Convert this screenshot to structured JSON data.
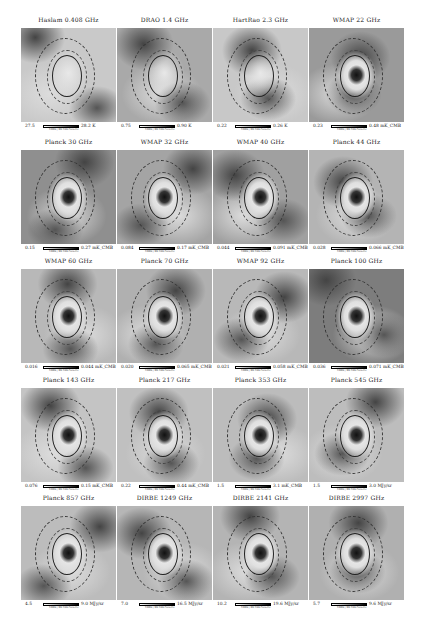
{
  "figure": {
    "panels": [
      {
        "title": "Haslam 0.408 GHz",
        "min": "27.5",
        "max": "28.2 K",
        "sub": "DBBS | BR DSS Galactic",
        "bg": "#c9c9c9",
        "core": "none"
      },
      {
        "title": "DRAO 1.4 GHz",
        "min": "0.75",
        "max": "0.90 K",
        "sub": "DBBS | BR DSS Galactic",
        "bg": "#a9a9a9",
        "core": "none"
      },
      {
        "title": "HartRao 2.3 GHz",
        "min": "0.22",
        "max": "0.26 K",
        "sub": "DBBS | BR DSS Galactic",
        "bg": "#c8c8c8",
        "core": "none"
      },
      {
        "title": "WMAP 22 GHz",
        "min": "0.23",
        "max": "0.48 mK_CMB",
        "sub": "DBBS | BR DSS Galactic",
        "bg": "#9a9a9a",
        "core": "dark"
      },
      {
        "title": "Planck 30 GHz",
        "min": "0.15",
        "max": "0.27 mK_CMB",
        "sub": "DBBS | BR DSS Galactic",
        "bg": "#8f8f8f",
        "core": "dark"
      },
      {
        "title": "WMAP 32 GHz",
        "min": "0.084",
        "max": "0.17 mK_CMB",
        "sub": "DBBS | BR DSS Galactic",
        "bg": "#a4a4a4",
        "core": "dark"
      },
      {
        "title": "WMAP 40 GHz",
        "min": "0.044",
        "max": "0.091 mK_CMB",
        "sub": "DBBS | BR DSS Galactic",
        "bg": "#a0a0a0",
        "core": "dark"
      },
      {
        "title": "Planck 44 GHz",
        "min": "0.028",
        "max": "0.066 mK_CMB",
        "sub": "DBBS | BR DSS Galactic",
        "bg": "#b4b4b4",
        "core": "dark"
      },
      {
        "title": "WMAP 60 GHz",
        "min": "0.016",
        "max": "0.044 mK_CMB",
        "sub": "DBBS | BR DSS Galactic",
        "bg": "#b8b8b8",
        "core": "dark"
      },
      {
        "title": "Planck 70 GHz",
        "min": "0.020",
        "max": "0.065 mK_CMB",
        "sub": "DBBS | BR DSS Galactic",
        "bg": "#b0b0b0",
        "core": "dark"
      },
      {
        "title": "WMAP 92 GHz",
        "min": "0.021",
        "max": "0.058 mK_CMB",
        "sub": "DBBS | BR DSS Galactic",
        "bg": "#b8b8b8",
        "core": "dark"
      },
      {
        "title": "Planck 100 GHz",
        "min": "0.036",
        "max": "0.071 mK_CMB",
        "sub": "DBBS | BR DSS Galactic",
        "bg": "#7d7d7d",
        "core": "dark"
      },
      {
        "title": "Planck 143 GHz",
        "min": "0.076",
        "max": "0.15 mK_CMB",
        "sub": "DBBS | BR DSS Galactic",
        "bg": "#c4c4c4",
        "core": "dark"
      },
      {
        "title": "Planck 217 GHz",
        "min": "0.22",
        "max": "0.44 mK_CMB",
        "sub": "DBBS | BR DSS Galactic",
        "bg": "#c0c0c0",
        "core": "dark"
      },
      {
        "title": "Planck 353 GHz",
        "min": "1.5",
        "max": "3.1 mK_CMB",
        "sub": "DBBS | BR DSS Galactic",
        "bg": "#bcbcbc",
        "core": "dark"
      },
      {
        "title": "Planck 545 GHz",
        "min": "1.5",
        "max": "3.0 MJy/sr",
        "sub": "DBBS | BR DSS Galactic",
        "bg": "#bdbdbd",
        "core": "dark"
      },
      {
        "title": "Planck 857 GHz",
        "min": "4.5",
        "max": "9.0 MJy/sr",
        "sub": "DBBS | BR DSS Galactic",
        "bg": "#bcbcbc",
        "core": "dark"
      },
      {
        "title": "DIRBE 1249 GHz",
        "min": "7.0",
        "max": "16.5 MJy/sr",
        "sub": "DBBS | BR DSS Galactic",
        "bg": "#b6b6b6",
        "core": "dark"
      },
      {
        "title": "DIRBE 2141 GHz",
        "min": "10.2",
        "max": "19.6 MJy/sr",
        "sub": "DBBS | BR DSS Galactic",
        "bg": "#b4b4b4",
        "core": "dark"
      },
      {
        "title": "DIRBE 2997 GHz",
        "min": "5.7",
        "max": "9.6 MJy/sr",
        "sub": "DBBS | BR DSS Galactic",
        "bg": "#b0b0b0",
        "core": "dark"
      }
    ]
  }
}
